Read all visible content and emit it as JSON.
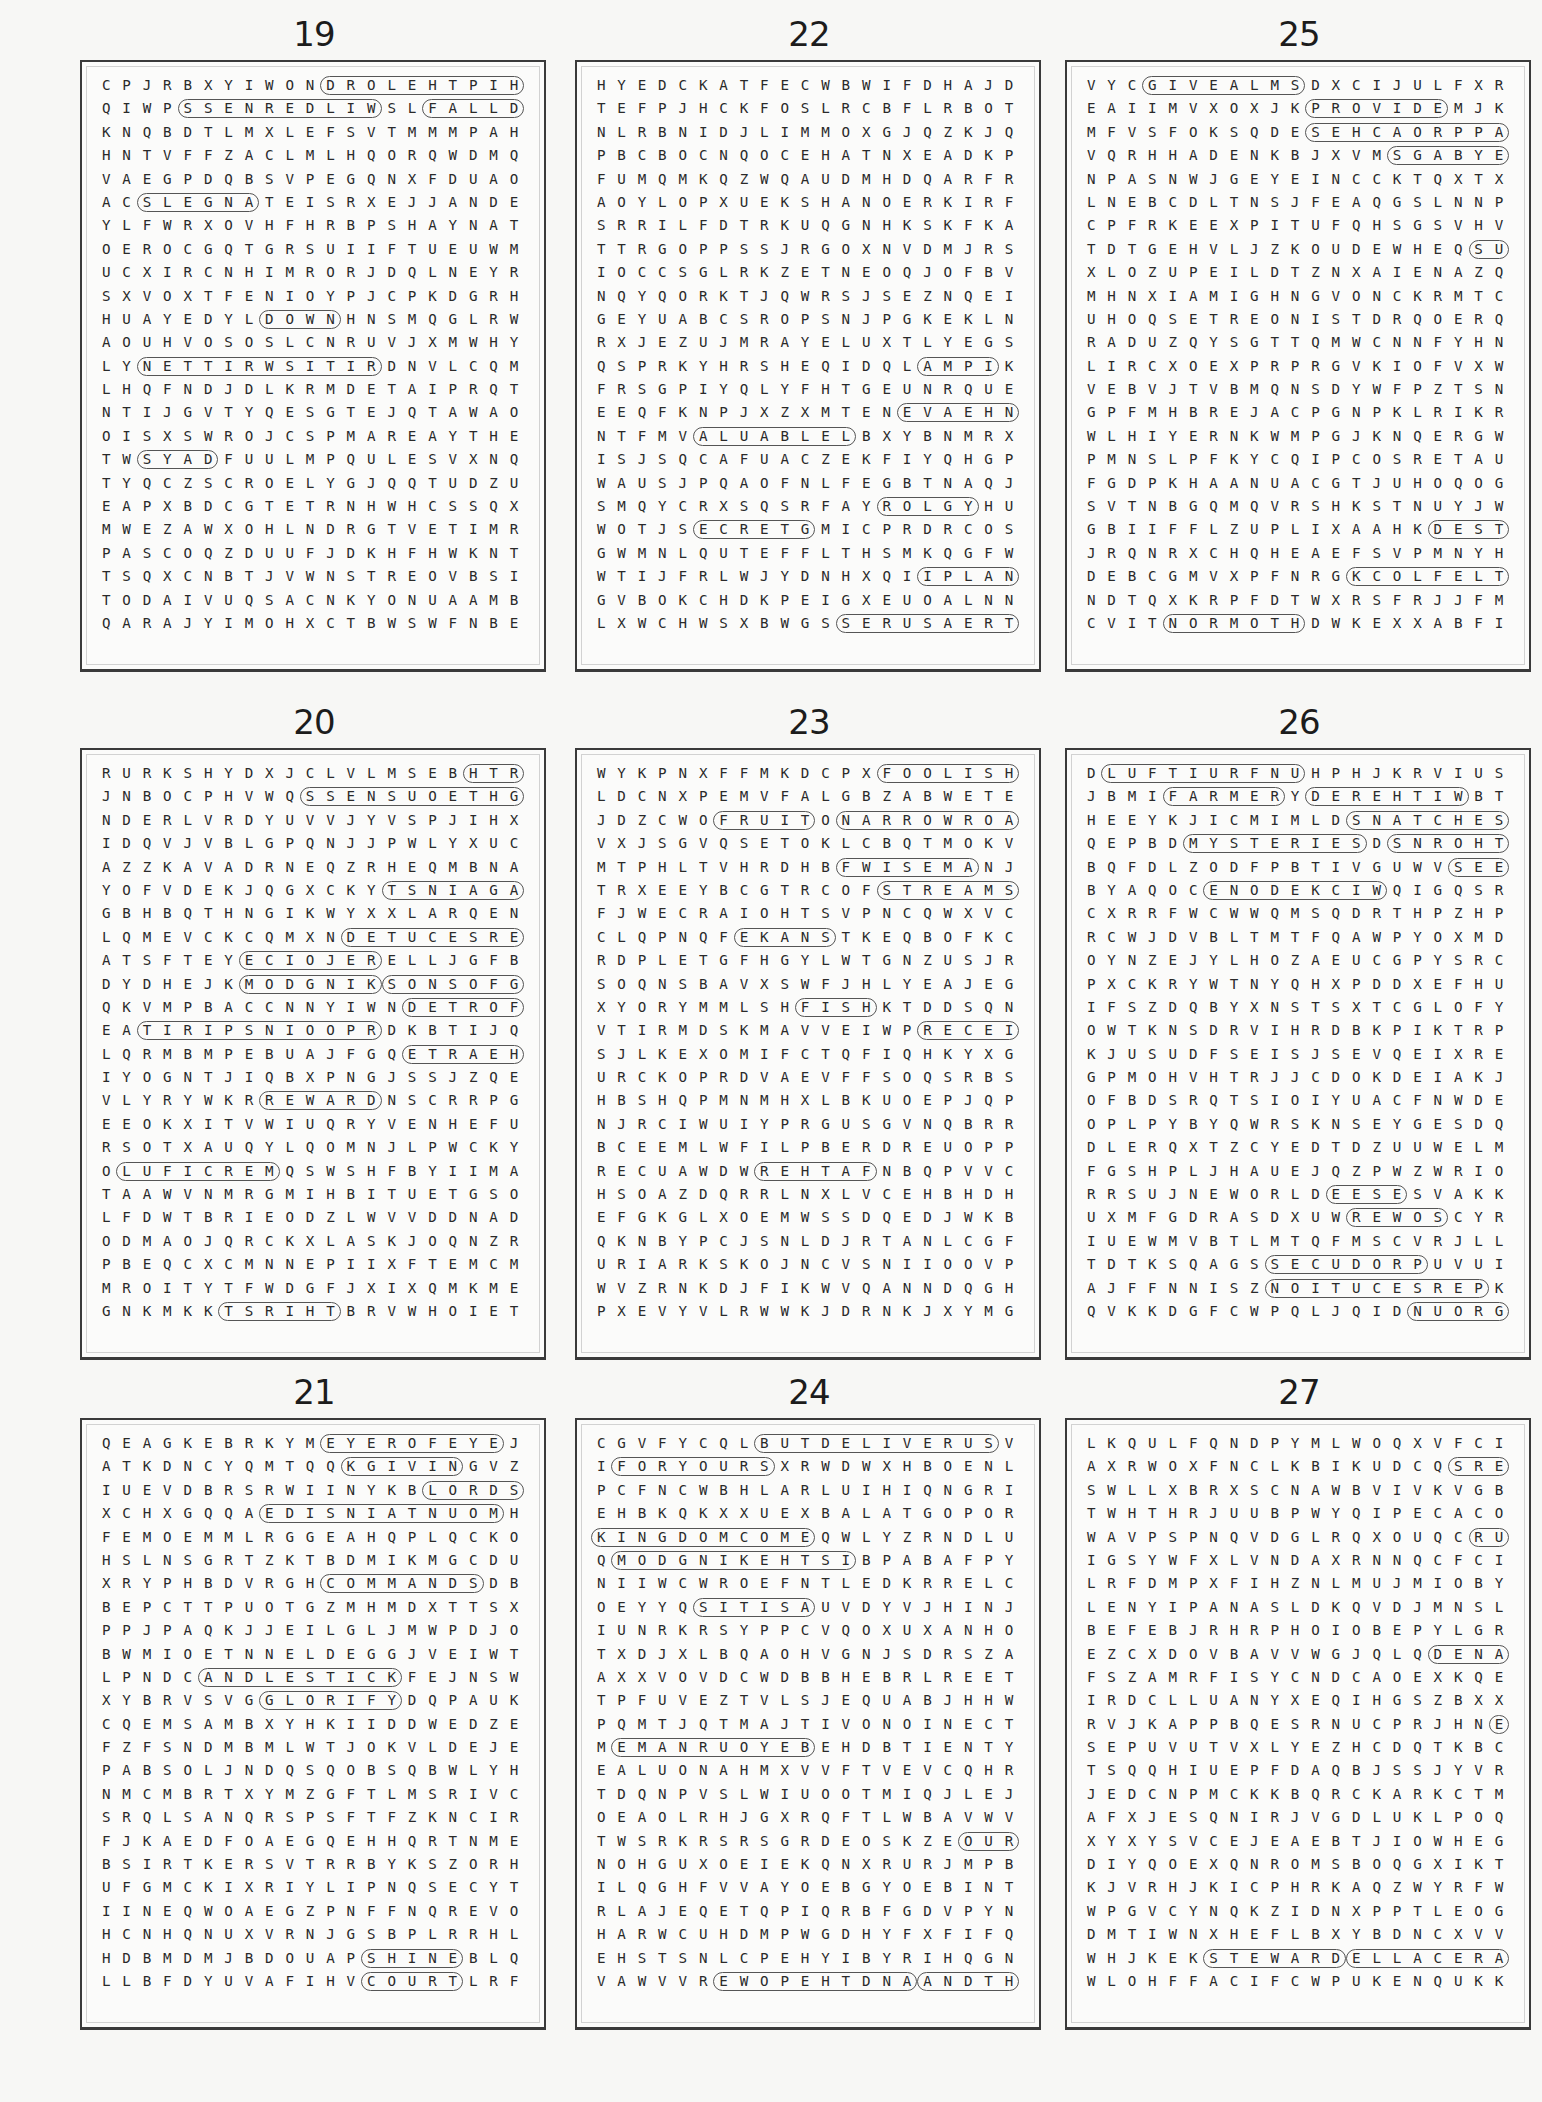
{
  "page": {
    "background": "#f7f7f5",
    "outline_color": "#555555"
  },
  "puzzles": [
    {
      "number": "19",
      "col": 0,
      "row": 0,
      "grid": [
        "CPJRBXYIWONDROLEHTPIHSROWUEI",
        "QIWPSSENREDLIWSLFALLDOWNZTRT",
        "KNQBDTLMXLEFSVTMMMPAHDRSNTSU",
        "HNTVFFZACLMLHQORQWDMQRYDQYRR",
        "VAEGPDQBSVPEGQNXFDUAOPHRKRES",
        "ACSLEGNATEISRXEJJANDEXNQXTVP",
        "YLFWRXOVHFHRBPSHAYNATKBCPWNG",
        "OEROCGQTGRSUIIFTUEUWMXSMAYJF",
        "UCXIRCNHIMRORJDQLNEYRMEWHJYG",
        "SXVOXTFENIOYPJCPKDGRHTOYTTAU",
        "HUAYEDYLDOWNHNSMQGLRWPNCILBC",
        "AOUHVOSOSLCNRUVJXMWHYECCUGAP",
        "LYNETTIRWSITIRDNVLCQMNYKEUWD",
        "LHQFNDJDLKRMDETAIPRQTLIIXAHE",
        "NTIJGVTYQESGTEJQTAWAONANXRMV",
        "OISXSWROJCSPMAREAYTHEQJGRMOI",
        "TWSYADFUULMPQULESVXNQESDWXUL",
        "TYQCZSCROELYGJQQTUDZUSQOFBTN",
        "EAPXBDCGTETRNHWHCSSQXODMMRHY",
        "MWEZAWXOHLNDRGTVETIMREMSREOF",
        "PASCOQZDUUFJDKHFHWKNTDDRXAFH",
        "TSQXCNBTJVWNSTREOVBSIDXEIDGY",
        "TODAIVUQSACNKYONUAAMBMLYIUOJ",
        "QARAJYIMOHXCTBWSWFNBENPFTPDH"
      ],
      "words_horizontal": [
        [
          0,
          11,
          14
        ],
        [
          1,
          4,
          10
        ],
        [
          1,
          16,
          8
        ],
        [
          5,
          2,
          6
        ],
        [
          10,
          8,
          4
        ],
        [
          12,
          2,
          12
        ],
        [
          16,
          2,
          4
        ]
      ],
      "words_other": [
        "PINNACLE",
        "STONES",
        "EMPHIS",
        "FLESH",
        "SHEP",
        "YOUTH",
        "DOWN",
        "THEY",
        "WORSHIPTHELORD",
        "WILDERNESS",
        "FALLDOWN",
        "ANGELS",
        "ITISWRITTEN",
        "DAYS"
      ]
    },
    {
      "number": "22",
      "col": 1,
      "row": 0,
      "grid": [
        "HYEDCKATFECWBWIFDHAJDBWTTQWX",
        "TEFPJHCKFOSLRCBFLRBOTRMYSXIP",
        "NLRBNIDJLIMMOXGJQZKJQOBMUFET",
        "PBCBOCNQOCEHATNXEADKPTCRDFSO",
        "FUMQMKQZWQAUDMHDQARFRHKLWMEM",
        "AOYLOPXUEKSHANOERKIRFEWQAHQO",
        "SRRILFDTRKUQGNHKSKFKARBFSCLR",
        "TTRGOPPSSJRGOXNVDMJRSYLPFXIR",
        "IOCCSGLRKZETNEOQJOFBVYEHHWNO",
        "NQYQORKTJQWRSJSEZNQEIGCDMCIW",
        "GEYUABCSROPSNJPGKEKLNRCNXQYQ",
        "RXJEZUJMRAYELUXTLYEGSNDVXOUU",
        "QSPRKYHRSHEQIDQLAMPIKMKSHGYU",
        "FRSGPIYQLYFHTGEUNRQUEVWFOSBN",
        "EEQFKNPJXZXMTENEVAEHNIOASEVO",
        "NTFMVALUABLELBXYBNMRXHIIOTKB",
        "ISJSQCAFUACZEKFIYQHGPPJDQIBL",
        "WAUSJPQAOFNLFEGBTNAQJUXPJRDA",
        "SMQYCRXSQSRFAYROLGYHUFRBLCFR",
        "WOTJSECRETGMICPRDRCOSQJHIOXW",
        "GWMNLQUTEFFLTHSMKQGFWSPPJPHS",
        "WTIJFRLWJYDNHXQIIPLANKRKRYVJ",
        "GVBOKCHDKPEIGXEUOALNNTNXPHYL",
        "LXWCHWSXBWGSSERUSAERTYYDKHMS"
      ],
      "words_horizontal": [
        [
          12,
          16,
          4
        ],
        [
          14,
          15,
          7
        ],
        [
          15,
          5,
          8
        ],
        [
          18,
          14,
          5
        ],
        [
          19,
          5,
          6
        ],
        [
          21,
          16,
          5
        ],
        [
          23,
          12,
          9
        ]
      ],
      "words_other": [
        "LAMP",
        "HEAVEN",
        "VALUABLE",
        "GLORY",
        "SECRET",
        "PLANK",
        "TREASURES",
        "FASTING",
        "NOMOS",
        "TSUDWAS",
        "TROWROW",
        "BROTHER",
        "WISE",
        "SOWTERAPHY"
      ]
    },
    {
      "number": "25",
      "col": 2,
      "row": 0,
      "grid": [
        "VYCGIVEALMSDXCIJULFXRDLTMUMW",
        "EAIIMVXOXJKPROVIDEMJKZRWETNO",
        "MFVSFOKSQDESEHCAORPPAWMSKXOH",
        "VQRHHADENKBJXVMSGABYENOMQLKE",
        "NPASNWJGEYEINCCKTQXTXMKFGWEA",
        "LNEBCDLTNSJFEAQGSLNNPRBRLWER",
        "CPFRKEEXPITUFQHSGSVHVRTFWXST",
        "TDTGEHVLJZKOUDEWHEQSUOIXNASW",
        "XLOZUPEILDTZNXAIENAZQRGSYGNI",
        "MHNXIAMIGHNGVONCKRMTCNXCWDOL",
        "UHOQSETREONISTDRQOERQBDSLWIL",
        "RADUZQYSGTTQMWCNNFYHNJWOULTB",
        "LIRCXOEXPRPRGVKIOFVXWOWJDGAE",
        "VEBVJTVBMQNSDYWFPZTSNOYEKTNA",
        "GPFMHBREJACPGNPKLRIKRVEYSKQE",
        "WLHIYERNKWMPGJKNQERGWNUEWHSM",
        "PMNSLPFKYCQIPCOSRETAUOLCMMQP",
        "FGDPKHAANUACGTJUHOQOGLXOPZMF",
        "SVTNBGQMQVRSHKSTNUYJWKZCBOFM",
        "GBIIFFLZUPLIXAAHKDESTROYSGKC",
        "JRQNRXCHQHEAEFSVPMNYHRBIRAKB",
        "DEBCGMVXPFNRGKCOLFELTTILRKBV",
        "NDTQXKRPFDTWXRSFRJJFMDWAAELC",
        "CVITNORMOTHDWKEXXABFIOVXINDE"
      ],
      "words_horizontal": [
        [
          0,
          3,
          8
        ],
        [
          1,
          11,
          7
        ],
        [
          2,
          11,
          10
        ],
        [
          3,
          15,
          9
        ],
        [
          7,
          19,
          7
        ],
        [
          19,
          17,
          8
        ],
        [
          21,
          13,
          11
        ],
        [
          23,
          4,
          7
        ]
      ],
      "words_other": [
        "GIVEALMS",
        "PROVIDE",
        "APPROACHES",
        "MONEYBAGS",
        "ANXIOUS",
        "DESTROYS",
        "LITTLEFLOCK",
        "MOTHRON",
        "HEARTS",
        "KEENLY",
        "REFLECTION",
        "SHEPHERDS",
        "MEDIATOR"
      ]
    },
    {
      "number": "20",
      "col": 0,
      "row": 1,
      "grid": [
        "RURKSHYDXJCLVLMSEBHTRAEZLUTV",
        "JNBOCPHVWQSSENSUOETHGIRUFZCJ",
        "NDERLVRDYUVVJYVSPJIHXYMOURNI",
        "IDQVJVBLGPQNJJPWLYXUCRKFSFGQ",
        "AZZKAVADRNEQZRHEQMBNAPRRFFSI",
        "YOFVDEKJQGXCKYTSNIAGALIVEQEM",
        "GBHBQTHNGIKWYXXLARQENWGSTHEB",
        "LQMEVCKCQMXNDETUCESREPOJQAGL",
        "ATSFTEYECIOJERELLJGFBWCWSGOA",
        "DYDHEJKMODGNIKSONSOFGODGIHDL",
        "QKVMPBACCNNYIWNDETROFMOCAUPV",
        "EATIRIPSNIOOPRDKBTIJQVDKIYL",
        "LQRMBMPEBUAJFGQETRAEHNIERUPB",
        "IYOGNTJIQBXPNGJSSJZQENNQFBXI",
        "VLYRYWKRREWARDNSCRRPGWVNOCAQ",
        "EEOKXITVWIUQRYVENHEFURJSQFCL",
        "RSOTXAUQYLQOMNJLPWCKYBNVJRSR",
        "OLUFICREMQSWSHFBYIIMATIREHNI",
        "TAAWVNMRGMIHBITUETGSOMRFBVAF",
        "LFDWTBRIEODZLWVVDDNADDEQLQUZ",
        "ODMAOJQRCKXLASKJOQNZRWOCWHWP",
        "PBEQCXCMNNEPIIXFTEMCMWVZASDK",
        "MROITYTFWDGFJXIXQMKMETBQSEIG",
        "GNKMKKTSRIHTBRVWHOIETTKKCRPU"
      ],
      "words_horizontal": [
        [
          0,
          18,
          5
        ],
        [
          1,
          10,
          13
        ],
        [
          2,
          22,
          5
        ],
        [
          5,
          14,
          10
        ],
        [
          7,
          12,
          11
        ],
        [
          8,
          7,
          7
        ],
        [
          9,
          7,
          7
        ],
        [
          9,
          14,
          9
        ],
        [
          10,
          15,
          9
        ],
        [
          11,
          2,
          12
        ],
        [
          12,
          15,
          12
        ],
        [
          14,
          8,
          6
        ],
        [
          17,
          1,
          8
        ],
        [
          17,
          21,
          7
        ],
        [
          23,
          6,
          6
        ]
      ],
      "words_other": [
        "EARTH",
        "RIGHTEOUSNESS",
        "MOURN",
        "EVILAGAINST",
        "PERSECUTED",
        "REJOICE",
        "KINGDOM",
        "SONSOFGOD",
        "COMFORTED",
        "POORINSPIRIT",
        "PUREINHEART",
        "REWARD",
        "MERCIFUL",
        "INHERIT",
        "THIRST",
        "HUNGER",
        "GLAD",
        "DESBLESSED",
        "MEEK",
        "LIVER"
      ]
    },
    {
      "number": "23",
      "col": 1,
      "row": 1,
      "grid": [
        "WYKPNXFFMKDCPXFOOLISHMANGSDU",
        "LDCNXPEMVFALGBZABWETEJOMOXNP",
        "JDZCWOFRUITONARROWROADRFNSAS",
        "VXJSGVQSETOKLCBQTMOKVPNQHFSB",
        "MTPHLTVHRDHBFWISEMANJWNXQBDF",
        "TRXEEYBCGTRCOFSTREAMSGSEEKQG",
        "FJWECRAIOHTSVPNCQWXVCLSEVLOW",
        "CLQPNQFEKANSTKEQBOFKCQDFRQKP",
        "RDPLETGFHGYLWTGNZUSJRERHIHIM",
        "SOQNSBAVXSWFJHLYEAJEGMKEZFEU",
        "XYORYMMLSHFISHKTDDSQNGGCACME",
        "VTIRMDSKMAVVEIWPRECEIVELIQBA",
        "SJLKEXOMIFCTQFIQHKYXGMSTVSHC",
        "URCKOPRDVAEVFFSOQSRBSECZTSFN",
        "HBSHQPMNMHXLBKUOEPJQPAQKAJOV",
        "NJRCIWUIYPRGUSGVNQBRRFTRBRUU",
        "BCEEMLWFILPBERDREUOPPJCEGENF",
        "RECUAWDWREHTAFNBQPVVCDJRMTDQ",
        "HSOAZDQRRLNXLVCEHBHDHTBNGNAF",
        "EFGKGLXOEMWSSDQEDJWKBKGSKKTY",
        "QKNBYPCJSNLDJRTANLCGFLDNOEIH",
        "URIARKSKOJNCVSNIIOOVPNQSDLOQ",
        "WVZRNKDJFIKWVQANNDQGHPSHNBNE",
        "PXEVYVLRWWKJDRNKJXYMGOBIXFAV"
      ],
      "words_horizontal": [
        [
          0,
          14,
          10
        ],
        [
          2,
          6,
          5
        ],
        [
          2,
          12,
          10
        ],
        [
          4,
          12,
          7
        ],
        [
          5,
          14,
          7
        ],
        [
          5,
          22,
          4
        ],
        [
          6,
          22,
          6
        ],
        [
          7,
          7,
          5
        ],
        [
          10,
          10,
          4
        ],
        [
          11,
          16,
          7
        ],
        [
          17,
          8,
          6
        ]
      ],
      "words_other": [
        "FOOLISHMAN",
        "FRUIT",
        "NARROWROAD",
        "WISEMAN",
        "STREAMS",
        "SEEK",
        "WOLVES",
        "SNAKE",
        "FISH",
        "RECEIVE",
        "FATHER",
        "SHEEP",
        "SAND",
        "FIND",
        "FOUNDATION",
        "REZIGNORE",
        "GATE",
        "DOGS",
        "KNOCK",
        "GOODTREE",
        "BREAD",
        "PEARLS"
      ]
    },
    {
      "number": "26",
      "col": 2,
      "row": 1,
      "grid": [
        "DLUFTIURFNUHPHJKRVIUSIGTBKDG",
        "JBMIFARMERYDEREHTIWBTWXOIRQJ",
        "HEEYKJICMIMLDSNATCHESMHOVDSY",
        "QEPBDMYSTERIESDSNROHTQJRFPJK",
        "BQFDLZODFPBTIVGUWVSEEZROZSZP",
        "BYAQOCENODEKCIWQIGQSRBSNSBFY",
        "CXRRFWCWWQMSQDRTHPZHPLPEFDVL",
        "RCWJDVBLTMTFQAWPYOXMDCNAXHWO",
        "OYNZEJYLHOZAEUCGPYSRCLONXHDB",
        "PXCKRYWTNYQHXPDDXEFHUZJGGEBI",
        "IFSZDQBYXNSTSXTCGLOFYSYXVLNR",
        "OWTKNSDRVIHRDBKPIKTRPOLOPCXD",
        "KJUSUDFSEISJSEVQEIXREGUWUSJS",
        "GPMOHVHTRJJCDOKDEIAKJRRAJVAB",
        "OFBDSRQTSIOIYUACFNWDESMXFUAG",
        "OPLPYBYQWRSKNSEYGESDQNHGVPPP",
        "DLERQXTZCYEDTDZUUWELMEJOJKFC",
        "FGSHPLJHAUEJQZPWZWRIOJLPRUQW",
        "RRSUJNEWORLDEESESVAKKNJDXFOY",
        "UXMFGDRASDXUWREWOSCYRORFQLTP",
        "IUEWMVBTLMTQFMSCVRJLLNODEPTH",
        "TDTKSQAGSSECUDORPUVUIUQUOSZA",
        "AJFFNNISZNOITUCESREPKOARVUCD",
        "QVKKDGFCWPQLJQIDNUORGDOOGVIB"
      ],
      "words_horizontal": [
        [
          0,
          1,
          10
        ],
        [
          1,
          4,
          6
        ],
        [
          1,
          11,
          8
        ],
        [
          2,
          13,
          8
        ],
        [
          3,
          5,
          9
        ],
        [
          3,
          15,
          6
        ],
        [
          4,
          18,
          3
        ],
        [
          5,
          6,
          9
        ],
        [
          18,
          12,
          4
        ],
        [
          19,
          13,
          5
        ],
        [
          20,
          22,
          6
        ],
        [
          21,
          9,
          8
        ],
        [
          22,
          9,
          11
        ],
        [
          23,
          16,
          10
        ]
      ],
      "words_other": [
        "UNFRUITFUL",
        "FARMER",
        "WITHERED",
        "SNATCHES",
        "MYSTERIES",
        "THORNS",
        "SEE",
        "WICKEDONE",
        "SEED",
        "SOWER",
        "DEPTH",
        "PRODUCES",
        "PERSECUTION",
        "GOODGROUND",
        "TORZON",
        "CROP",
        "STUMBLES",
        "BIRDS",
        "GOODFRUIT",
        "SCORCHED",
        "WORLDLY"
      ]
    },
    {
      "number": "21",
      "col": 0,
      "row": 2,
      "grid": [
        "QEAGKEBRKYMEYEROFEYEJYBYYWFO",
        "ATKDNCYQMTQQKGIVINGVZNGTMIRC",
        "IUEVDBRSRWIINYKBLORDSPRAYERK",
        "XCHXGQQAEDISNIATNUOMHQJOQCLR",
        "FEMOEMMLRGGEAHQPLQCKODYDEENQ",
        "HSLNSGRTZKTBDMIKMGCDUYMTJERC",
        "XRYPHBDVRGHCOMMANDSDBAZMSYMM",
        "BEPCTTPUOTGZMHMDXTTSXTTHELAW",
        "PPJPAQKJJEILGLJMWPDJOAVLAORS",
        "BWMIOETNNELDEGGJVEIWTCBIKVBR",
        "LPNDCANDLESTICKFEJNSWCEWWEPQ",
        "XYBRVSVGGLORIFYDQPAUKOPQGYDH",
        "CQEMSAMBXYHKIIDDWEDZEMEQPONL",
        "FZFSNDMBMLWTJOKVLDEJEPRKDUWD",
        "PABSOLJNDQSQOBSQBWLYHLFYPRNK",
        "NMCMBRTXYMZGFTLMSRIVCIEFDEMB",
        "SRQLSANQRSPSFTFZKNCIRSCRBNNY",
        "FJKAEDFOAEGQEHHQRTNMEHTWVEOM",
        "BSIRTKERSVTRRBYKSZORHEDGRMIX",
        "UFGMCKIXRIYLIPNQSECYTDTPLIXG",
        "IINEQWOAEGZPNFFNQREVOGGJCEFS",
        "HCNHQNUXVRNJGSBPLRRHLMSXVSVJ",
        "HDBMDMJBDOUAPSHINEBLQIFAEECK",
        "LLBFDYUVAFIHVCOURTLRFEPBQKES"
      ],
      "words_horizontal": [
        [
          0,
          11,
          9
        ],
        [
          1,
          12,
          6
        ],
        [
          2,
          16,
          11
        ],
        [
          3,
          8,
          12
        ],
        [
          4,
          22,
          5
        ],
        [
          6,
          11,
          8
        ],
        [
          7,
          22,
          6
        ],
        [
          10,
          5,
          10
        ],
        [
          11,
          8,
          7
        ],
        [
          22,
          13,
          5
        ],
        [
          23,
          13,
          5
        ]
      ],
      "words_other": [
        "EYEFOREYE",
        "GIVING",
        "LORDSPRAYER",
        "MOUNTAINSIDE",
        "NEEDY",
        "COMMANDS",
        "THELAW",
        "CANDLESTICK",
        "GLORIFY",
        "SHINE",
        "COURT",
        "SALT",
        "THIEVES",
        "LIGHT",
        "PETITION",
        "STRIVE",
        "EUCHRIST",
        "HATE",
        "OATHS",
        "TEMPLE",
        "ENEMY"
      ]
    },
    {
      "number": "24",
      "col": 1,
      "row": 2,
      "grid": [
        "CGVFYCQLBUTDELIVERUSVXDNDDGO",
        "IFORYOURSXRWDWXHBOENLFMWACXA",
        "PCFNCWBHLARLUIHIQNGRIXMEUTRN",
        "EHBKQKXXUEXBALATGOPORWRCPDGD",
        "KINGDOMCOMEQWLYZRNDLUBHKITVD",
        "QMODGNIKEHTSIBPABAFPYGKOMGKO",
        "NIIWCWROEFNTLEDKRRELCTPNFRLN",
        "OEYYQSITISAUVDYVJHINJRERJSFO",
        "IUNRKRSYPPCVQOXUXANHOVOUWTNT",
        "TXDJXLBQAOHVGNJSDRSZAMVDKBIL",
        "AXXVOVDCWDBBHEBRLREETEKCNELE",
        "TPFUVEZTVLSJEQUABJHHWLXEPDCA",
        "PQMTJQTMAJTIVONOINECTKMNERYD",
        "MEMANRUOYEBEHDBTIENTYAQGSUJU",
        "EALUONAHMXVVFTVEVCQHRAFCJOGS",
        "TDQNPVSLWIUOOTMIQJLEJMDRVQHR",
        "OEAOLRHJGXRQFTLWBAVWVJALUSQS",
        "TWSRKRSRSGRDEOSKZEOURDEBTORS",
        "NOHGUXOEIEKQNXRURJMPBCONCCQF",
        "ILQGHFVVAYOEBGYOEBINTTBWFIYW",
        "RLAJEQETQPIQRBFGDVPYNBDFUORR",
        "HARWCUHDMPWGDHYFXFIFQXWBYYBJ",
        "EHSTSNLCPEHYIBYRIHQGNDPDRPSO",
        "VAWVVREWOPEHTDNAANDTHEGLORY"
      ],
      "words_horizontal": [
        [
          0,
          8,
          12
        ],
        [
          1,
          1,
          8
        ],
        [
          4,
          0,
          11
        ],
        [
          5,
          1,
          12
        ],
        [
          7,
          5,
          6
        ],
        [
          13,
          1,
          10
        ],
        [
          17,
          18,
          9
        ],
        [
          23,
          6,
          10
        ],
        [
          23,
          16,
          11
        ]
      ],
      "words_other": [
        "BUTDELIVERUS",
        "FORYOURS",
        "KINGDOMCOME",
        "ISTHEKINGDOM",
        "ASITIS",
        "BEYOURNAME",
        "OURDEBTORS",
        "ANDTHEPOWER",
        "ANDTHEGLORY",
        "WILLBEDONE",
        "ANDLEADUS",
        "TEMPTATION",
        "SUBDUE",
        "DEBTS",
        "FATHER",
        "HALLOWED",
        "HEAVEN",
        "AMEN",
        "FOREVER",
        "EARTH",
        "OURDAILY"
      ]
    },
    {
      "number": "27",
      "col": 2,
      "row": 2,
      "grid": [
        "LKQULFQNDPYMLWOQXVFCIQMPXCIG",
        "AXRWOXFNCLKBIKUDCQSREROBALNT",
        "SWLLXBRXSCNAWBVIVKVGBQGXZICW",
        "TWHTHRJUUBPWYQIPECACOZFFNNXH",
        "WAVPSPNQVDGLRQXOUQCRUOHENOFU",
        "IGSYWFXLVNDAXRNNQCFCIQVMFZNC",
        "LRFDMPXFIHZNLMUJMIOBYECXDWLP",
        "LENYIPANASLDKQVDJMNSLTQHMPVS",
        "BEFEBJRHRPHOIOBEPYLGRTWPJMVS",
        "EZCXDOVBAVVWGJQLQDENARIUSHPV",
        "FSZAMRFISYCNDCAOEXKQEMNOONYU",
        "IRDCLLUANYXEQIHGSZBXXUQIJMMQ",
        "RVJKAPPBQESRNUCPRJHNEERHTWXN",
        "SEPUVUTVXLYEZHCDQTKBCEOYLADA",
        "TSQQHIUEPFDAQBJSSJYVRRLRRGQS",
        "JEDCNPMCKKBQRCKARKCTMUNDQEGR",
        "AFXJESQNIRJVGDLUKLPOQVBIISDD",
        "XYXYSVCEJEAEBTJIOWHEGSLWRDNG",
        "DIYQOEXQNROMSBOQGXIKTTLPAQOF",
        "KJVRHJKICPHRKAQZWYRFWFRMLUWL",
        "WPGVCYNQKZIDNXPPTLEOGZYSDQRP",
        "DMTIWNXHEFLBXYBDNCXVVEVIFVOB",
        "WHJKEKSTEWARDELLACERAYNAMQNL",
        "WLOHFFACIFCWPUKENQUKKRMBVHGT"
      ],
      "words_horizontal": [
        [
          1,
          18,
          8
        ],
        [
          4,
          19,
          7
        ],
        [
          9,
          17,
          8
        ],
        [
          10,
          22,
          4
        ],
        [
          12,
          20,
          5
        ],
        [
          21,
          21,
          4
        ],
        [
          22,
          6,
          7
        ],
        [
          22,
          13,
          13
        ]
      ],
      "words_other": [
        "LABORERS",
        "ONEHOUR",
        "DENARIUS",
        "NOON",
        "THREE",
        "FIVE",
        "STEWARD",
        "MANYARECALLED",
        "LASTWILLBEFIRST",
        "VINEYARD",
        "GRUMBLED",
        "WAGES",
        "HIRE",
        "NEWCASTLE",
        "LOWERED",
        "DEAL",
        "FOWLS",
        "ELEVENTH",
        "HIRED"
      ]
    }
  ]
}
